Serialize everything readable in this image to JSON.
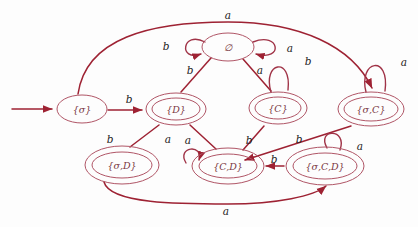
{
  "diagram": {
    "type": "finite-state-automaton",
    "title": "",
    "colors": {
      "edge": "#9e2233",
      "state_outline": "#b05566",
      "label": "#1d1d1d",
      "background": "#fdfdfd"
    },
    "alphabet": [
      "a",
      "b"
    ],
    "start_state": "{σ}",
    "states": [
      {
        "id": "sigma",
        "label": "{σ}",
        "accepting": false,
        "x": 82,
        "y": 109,
        "rx": 25,
        "ry": 14
      },
      {
        "id": "empty",
        "label": "∅",
        "accepting": false,
        "x": 228,
        "y": 47,
        "rx": 26,
        "ry": 14
      },
      {
        "id": "D",
        "label": "{D}",
        "accepting": true,
        "x": 176,
        "y": 109,
        "rx": 30,
        "ry": 16
      },
      {
        "id": "C",
        "label": "{C}",
        "accepting": true,
        "x": 278,
        "y": 108,
        "rx": 29,
        "ry": 16
      },
      {
        "id": "sigmaC",
        "label": "{σ,C}",
        "accepting": true,
        "x": 371,
        "y": 109,
        "rx": 33,
        "ry": 17
      },
      {
        "id": "sigmaD",
        "label": "{σ,D}",
        "accepting": true,
        "x": 122,
        "y": 165,
        "rx": 37,
        "ry": 19
      },
      {
        "id": "CD",
        "label": "{C,D}",
        "accepting": true,
        "x": 228,
        "y": 166,
        "rx": 36,
        "ry": 18
      },
      {
        "id": "sigmaCD",
        "label": "{σ,C,D}",
        "accepting": true,
        "x": 325,
        "y": 166,
        "rx": 39,
        "ry": 19
      }
    ],
    "transitions": [
      {
        "id": "t1",
        "from": "sigma",
        "to": "D",
        "symbol": "b",
        "label_x": 129,
        "label_y": 100
      },
      {
        "id": "t2",
        "from": "sigma",
        "to": "sigmaC",
        "symbol": "a",
        "label_x": 228,
        "label_y": 16
      },
      {
        "id": "t3",
        "from": "empty",
        "to": "empty",
        "symbol": "b",
        "label_x": 166,
        "label_y": 47,
        "loop": "left"
      },
      {
        "id": "t4",
        "from": "empty",
        "to": "empty",
        "symbol": "a",
        "label_x": 290,
        "label_y": 49,
        "loop": "right"
      },
      {
        "id": "t5",
        "from": "empty",
        "to": "D",
        "symbol": "b",
        "label_x": 190,
        "label_y": 71
      },
      {
        "id": "t6",
        "from": "empty",
        "to": "C",
        "symbol": "a",
        "label_x": 260,
        "label_y": 71
      },
      {
        "id": "t7",
        "from": "C",
        "to": "C",
        "symbol": "b",
        "label_x": 308,
        "label_y": 62,
        "loop": "top"
      },
      {
        "id": "t8",
        "from": "sigmaC",
        "to": "sigmaC",
        "symbol": "a",
        "label_x": 404,
        "label_y": 63,
        "loop": "top"
      },
      {
        "id": "t9",
        "from": "D",
        "to": "sigmaD",
        "symbol": "b",
        "label_x": 110,
        "label_y": 140
      },
      {
        "id": "t10",
        "from": "D",
        "to": "CD",
        "symbol": "a",
        "label_x": 168,
        "label_y": 140
      },
      {
        "id": "t11",
        "from": "CD",
        "to": "CD",
        "symbol": "a",
        "label_x": 188,
        "label_y": 141,
        "loop": "top"
      },
      {
        "id": "t12",
        "from": "C",
        "to": "CD",
        "symbol": "b",
        "label_x": 249,
        "label_y": 141
      },
      {
        "id": "t13",
        "from": "sigmaC",
        "to": "CD",
        "symbol": "b",
        "label_x": 299,
        "label_y": 140
      },
      {
        "id": "t14",
        "from": "sigmaCD",
        "to": "CD",
        "symbol": "b",
        "label_x": 274,
        "label_y": 160
      },
      {
        "id": "t15",
        "from": "sigmaCD",
        "to": "sigmaCD",
        "symbol": "a",
        "label_x": 360,
        "label_y": 147,
        "loop": "top"
      },
      {
        "id": "t16",
        "from": "sigmaD",
        "to": "sigmaCD",
        "symbol": "a",
        "label_x": 226,
        "label_y": 212
      }
    ],
    "start_arrow": {
      "from_x": 12,
      "from_y": 109,
      "to_x": 55,
      "to_y": 109
    }
  }
}
